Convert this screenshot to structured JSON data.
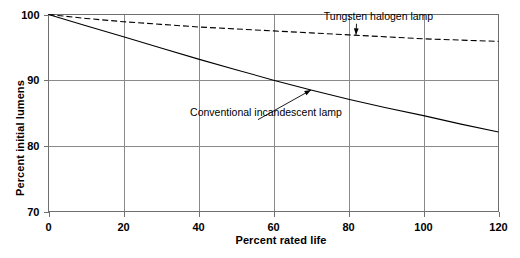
{
  "chart_data": {
    "type": "line",
    "title": "",
    "xlabel": "Percent rated life",
    "ylabel": "Percent initial lumens",
    "xlim": [
      0,
      120
    ],
    "ylim": [
      70,
      100
    ],
    "grid": true,
    "legend_position": "inline-annotations",
    "xticks": [
      0,
      20,
      40,
      60,
      80,
      100,
      120
    ],
    "xtick_labels": [
      "0",
      "20",
      "40",
      "60",
      "80",
      "100",
      "120"
    ],
    "yticks": [
      70,
      80,
      90,
      100
    ],
    "ytick_labels": [
      "70",
      "80",
      "90",
      "100"
    ],
    "x": [
      0,
      10,
      20,
      30,
      40,
      50,
      60,
      70,
      80,
      90,
      100,
      110,
      120
    ],
    "series": [
      {
        "name": "Tungsten halogen lamp",
        "style": "dashed",
        "values": [
          100,
          99.4,
          98.9,
          98.5,
          98.1,
          97.8,
          97.5,
          97.2,
          96.9,
          96.6,
          96.3,
          96.1,
          95.9
        ]
      },
      {
        "name": "Conventional incandescent lamp",
        "style": "solid",
        "values": [
          100,
          98.3,
          96.6,
          94.9,
          93.2,
          91.6,
          90.0,
          88.5,
          87.1,
          85.8,
          84.6,
          83.3,
          82.1
        ]
      }
    ],
    "annotations": [
      {
        "label": "Tungsten halogen lamp",
        "target_x": 82,
        "target_y": 96.9,
        "text_x": 88,
        "text_y": 99.2
      },
      {
        "label": "Conventional incandescent lamp",
        "target_x": 70,
        "target_y": 88.5,
        "text_x": 58,
        "text_y": 84.6
      }
    ]
  }
}
